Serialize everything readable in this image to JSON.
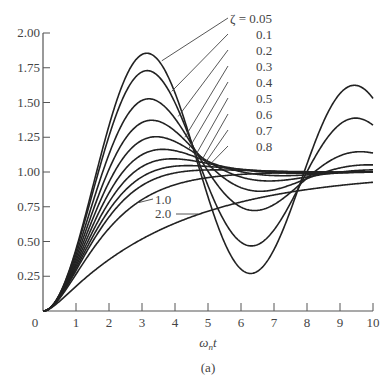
{
  "chart_data": {
    "type": "line",
    "title": "",
    "subtitle": "(a)",
    "xlabel": "ω_n t",
    "ylabel": "",
    "xlim": [
      0,
      10
    ],
    "ylim": [
      0,
      2.0
    ],
    "grid": false,
    "x_ticks": [
      "0",
      "1",
      "2",
      "3",
      "4",
      "5",
      "6",
      "7",
      "8",
      "9",
      "10"
    ],
    "y_ticks": [
      "0.25",
      "0.50",
      "0.75",
      "1.00",
      "1.25",
      "1.50",
      "1.75",
      "2.00"
    ],
    "legend_position": "inline labels with leader lines",
    "zeta_label_prefix": "ζ =",
    "series": [
      {
        "name": "0.05",
        "zeta": 0.05,
        "peak": 1.85,
        "peak_x": 3.15
      },
      {
        "name": "0.1",
        "zeta": 0.1,
        "peak": 1.73,
        "peak_x": 3.15
      },
      {
        "name": "0.2",
        "zeta": 0.2,
        "peak": 1.53,
        "peak_x": 3.2
      },
      {
        "name": "0.3",
        "zeta": 0.3,
        "peak": 1.37,
        "peak_x": 3.3
      },
      {
        "name": "0.4",
        "zeta": 0.4,
        "peak": 1.25,
        "peak_x": 3.4
      },
      {
        "name": "0.5",
        "zeta": 0.5,
        "peak": 1.16,
        "peak_x": 3.6
      },
      {
        "name": "0.6",
        "zeta": 0.6,
        "peak": 1.09,
        "peak_x": 3.9
      },
      {
        "name": "0.7",
        "zeta": 0.7,
        "peak": 1.05,
        "peak_x": 4.4
      },
      {
        "name": "0.8",
        "zeta": 0.8,
        "peak": 1.02,
        "peak_x": 5.2
      },
      {
        "name": "1.0",
        "zeta": 1.0,
        "value_at_10": 1.0
      },
      {
        "name": "2.0",
        "zeta": 2.0,
        "value_at_10": 0.91
      }
    ]
  }
}
